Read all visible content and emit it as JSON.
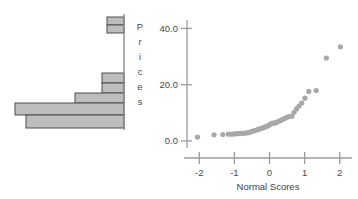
{
  "figure": {
    "background_color": "#ffffff",
    "panels": [
      "histogram-panel",
      "normal-probability-plot-panel"
    ]
  },
  "histogram": {
    "name": "prices-histogram",
    "orientation": "horizontal-bars-stacked-vertically",
    "axis_color": "#808080",
    "bar_fill_color": "#bdbdbd",
    "bar_stroke_color": "#4d4d4d",
    "vertical_axis_x": 124,
    "bars": [
      {
        "index": 0,
        "length": 17,
        "top": 17,
        "height": 8
      },
      {
        "index": 1,
        "length": 17,
        "top": 25,
        "height": 8
      },
      {
        "index": 2,
        "length": 0,
        "top": 33,
        "height": 8
      },
      {
        "index": 3,
        "length": 0,
        "top": 41,
        "height": 8
      },
      {
        "index": 4,
        "length": 0,
        "top": 49,
        "height": 8
      },
      {
        "index": 5,
        "length": 0,
        "top": 57,
        "height": 8
      },
      {
        "index": 6,
        "length": 0,
        "top": 65,
        "height": 8
      },
      {
        "index": 7,
        "length": 22,
        "top": 73,
        "height": 10
      },
      {
        "index": 8,
        "length": 22,
        "top": 83,
        "height": 10
      },
      {
        "index": 9,
        "length": 49,
        "top": 93,
        "height": 10
      },
      {
        "index": 10,
        "length": 109,
        "top": 103,
        "height": 12
      },
      {
        "index": 11,
        "length": 98,
        "top": 115,
        "height": 13
      }
    ]
  },
  "chart_data": {
    "type": "scatter",
    "title": "",
    "xlabel": "Normal Scores",
    "ylabel": "Prices",
    "ylabel_letters": [
      "P",
      "r",
      "i",
      "c",
      "e",
      "s"
    ],
    "xlim": [
      -2.35,
      2.35
    ],
    "ylim": [
      -2.5,
      43.0
    ],
    "xticks": [
      -2,
      -1,
      0,
      1,
      2
    ],
    "xtick_labels": [
      "-2",
      "-1",
      "0",
      "1",
      "2"
    ],
    "yticks": [
      0.0,
      20.0,
      40.0
    ],
    "ytick_labels": [
      "0.0",
      "20.0",
      "40.0"
    ],
    "grid": false,
    "legend": null,
    "marker_color": "#a8a8a8",
    "marker_size": 2.6,
    "axis_color": "#9a9a9a",
    "points": [
      {
        "x": -2.05,
        "y": 1.4
      },
      {
        "x": -1.58,
        "y": 2.2
      },
      {
        "x": -1.33,
        "y": 2.3
      },
      {
        "x": -1.17,
        "y": 2.4
      },
      {
        "x": -1.08,
        "y": 2.4
      },
      {
        "x": -1.0,
        "y": 2.5
      },
      {
        "x": -0.93,
        "y": 2.6
      },
      {
        "x": -0.86,
        "y": 2.6
      },
      {
        "x": -0.8,
        "y": 2.7
      },
      {
        "x": -0.74,
        "y": 2.7
      },
      {
        "x": -0.68,
        "y": 2.8
      },
      {
        "x": -0.62,
        "y": 2.9
      },
      {
        "x": -0.57,
        "y": 3.1
      },
      {
        "x": -0.52,
        "y": 3.3
      },
      {
        "x": -0.47,
        "y": 3.5
      },
      {
        "x": -0.42,
        "y": 3.7
      },
      {
        "x": -0.37,
        "y": 3.9
      },
      {
        "x": -0.32,
        "y": 4.1
      },
      {
        "x": -0.27,
        "y": 4.3
      },
      {
        "x": -0.23,
        "y": 4.5
      },
      {
        "x": -0.18,
        "y": 4.7
      },
      {
        "x": -0.14,
        "y": 4.9
      },
      {
        "x": -0.09,
        "y": 5.1
      },
      {
        "x": -0.05,
        "y": 5.4
      },
      {
        "x": 0.0,
        "y": 5.7
      },
      {
        "x": 0.05,
        "y": 6.2
      },
      {
        "x": 0.09,
        "y": 6.3
      },
      {
        "x": 0.14,
        "y": 6.4
      },
      {
        "x": 0.18,
        "y": 6.5
      },
      {
        "x": 0.23,
        "y": 6.8
      },
      {
        "x": 0.28,
        "y": 7.1
      },
      {
        "x": 0.33,
        "y": 7.4
      },
      {
        "x": 0.38,
        "y": 7.7
      },
      {
        "x": 0.43,
        "y": 8.0
      },
      {
        "x": 0.48,
        "y": 8.3
      },
      {
        "x": 0.53,
        "y": 8.6
      },
      {
        "x": 0.58,
        "y": 8.7
      },
      {
        "x": 0.64,
        "y": 8.8
      },
      {
        "x": 0.7,
        "y": 10.2
      },
      {
        "x": 0.77,
        "y": 11.4
      },
      {
        "x": 0.84,
        "y": 12.4
      },
      {
        "x": 0.92,
        "y": 13.5
      },
      {
        "x": 1.01,
        "y": 15.2
      },
      {
        "x": 1.12,
        "y": 17.6
      },
      {
        "x": 1.33,
        "y": 17.9
      },
      {
        "x": 1.62,
        "y": 29.5
      },
      {
        "x": 2.02,
        "y": 33.5
      }
    ]
  }
}
